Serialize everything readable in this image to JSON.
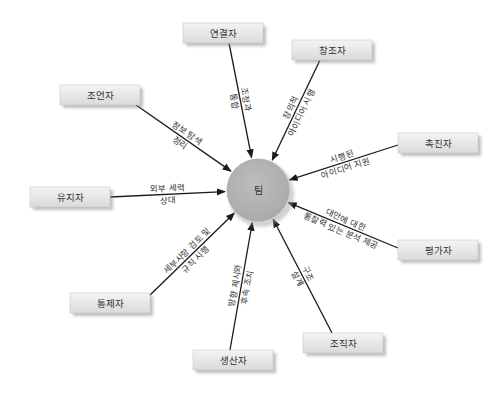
{
  "center": {
    "label": "팀",
    "color": "#b3b3b3"
  },
  "roles": [
    {
      "id": "connector",
      "label": "연결자",
      "edge_lines": [
        "조정과",
        "통합"
      ]
    },
    {
      "id": "creator",
      "label": "창조자",
      "edge_lines": [
        "창의적",
        "아이디어 시행"
      ]
    },
    {
      "id": "advisor",
      "label": "조언자",
      "edge_lines": [
        "정보 탐색",
        "정리"
      ]
    },
    {
      "id": "promoter",
      "label": "촉진자",
      "edge_lines": [
        "시행된",
        "아이디어 지원"
      ]
    },
    {
      "id": "maintainer",
      "label": "유지자",
      "edge_lines": [
        "외부 세력",
        "상대"
      ]
    },
    {
      "id": "assessor",
      "label": "평가자",
      "edge_lines": [
        "대안에 대한",
        "통찰력 있는 분석 제공"
      ]
    },
    {
      "id": "controller",
      "label": "통제자",
      "edge_lines": [
        "세부사항 검토 및",
        "규칙 시행"
      ]
    },
    {
      "id": "producer",
      "label": "생산자",
      "edge_lines": [
        "방향 제시와",
        "후속 조치"
      ]
    },
    {
      "id": "organizer",
      "label": "조직자",
      "edge_lines": [
        "구조",
        "설계"
      ]
    }
  ],
  "colors": {
    "box_top": "#f2f2f2",
    "box_bottom": "#dcdcdc",
    "line": "#1a1a1a",
    "circle": "#b3b3b3"
  }
}
